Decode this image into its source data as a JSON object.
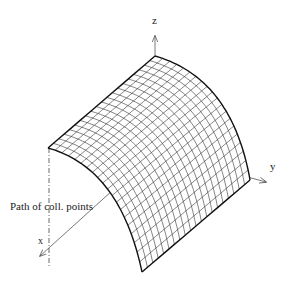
{
  "diagram": {
    "axes": {
      "z_label": "z",
      "y_label": "y",
      "x_label": "x"
    },
    "annotation": "Path of coll. points",
    "surface": {
      "type": "cylindrical-shell-mesh",
      "grid_u": 20,
      "grid_v": 20,
      "edge_color": "#111111",
      "mesh_color": "#333333"
    }
  }
}
